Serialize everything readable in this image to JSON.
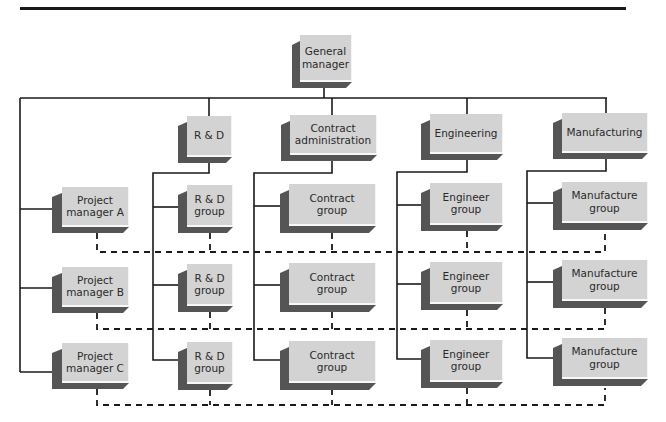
{
  "diagram": {
    "title": "",
    "colors": {
      "face": "#d3d3d3",
      "shadow": "#555555",
      "line": "#1a1a1a"
    },
    "nodes": {
      "gm": {
        "label": "General\nmanager"
      },
      "rd": {
        "label": "R & D"
      },
      "contract_admin": {
        "label": "Contract\nadministration"
      },
      "engineering": {
        "label": "Engineering"
      },
      "manufacturing": {
        "label": "Manufacturing"
      },
      "pm_a": {
        "label": "Project\nmanager A"
      },
      "pm_b": {
        "label": "Project\nmanager B"
      },
      "pm_c": {
        "label": "Project\nmanager C"
      },
      "rd_group_1": {
        "label": "R & D\ngroup"
      },
      "rd_group_2": {
        "label": "R & D\ngroup"
      },
      "rd_group_3": {
        "label": "R & D\ngroup"
      },
      "contract_group_1": {
        "label": "Contract\ngroup"
      },
      "contract_group_2": {
        "label": "Contract\ngroup"
      },
      "contract_group_3": {
        "label": "Contract\ngroup"
      },
      "engineer_group_1": {
        "label": "Engineer\ngroup"
      },
      "engineer_group_2": {
        "label": "Engineer\ngroup"
      },
      "engineer_group_3": {
        "label": "Engineer\ngroup"
      },
      "manufacture_group_1": {
        "label": "Manufacture\ngroup"
      },
      "manufacture_group_2": {
        "label": "Manufacture\ngroup"
      },
      "manufacture_group_3": {
        "label": "Manufacture\ngroup"
      }
    },
    "edges_solid": [
      [
        "gm",
        "rd"
      ],
      [
        "gm",
        "contract_admin"
      ],
      [
        "gm",
        "engineering"
      ],
      [
        "gm",
        "manufacturing"
      ],
      [
        "gm",
        "pm_a"
      ],
      [
        "gm",
        "pm_b"
      ],
      [
        "gm",
        "pm_c"
      ],
      [
        "rd",
        "rd_group_1"
      ],
      [
        "rd",
        "rd_group_2"
      ],
      [
        "rd",
        "rd_group_3"
      ],
      [
        "contract_admin",
        "contract_group_1"
      ],
      [
        "contract_admin",
        "contract_group_2"
      ],
      [
        "contract_admin",
        "contract_group_3"
      ],
      [
        "engineering",
        "engineer_group_1"
      ],
      [
        "engineering",
        "engineer_group_2"
      ],
      [
        "engineering",
        "engineer_group_3"
      ],
      [
        "manufacturing",
        "manufacture_group_1"
      ],
      [
        "manufacturing",
        "manufacture_group_2"
      ],
      [
        "manufacturing",
        "manufacture_group_3"
      ]
    ],
    "edges_dashed": [
      [
        "pm_a",
        "rd_group_1",
        "contract_group_1",
        "engineer_group_1",
        "manufacture_group_1"
      ],
      [
        "pm_b",
        "rd_group_2",
        "contract_group_2",
        "engineer_group_2",
        "manufacture_group_2"
      ],
      [
        "pm_c",
        "rd_group_3",
        "contract_group_3",
        "engineer_group_3",
        "manufacture_group_3"
      ]
    ]
  }
}
